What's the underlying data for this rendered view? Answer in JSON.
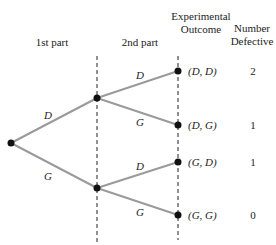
{
  "headers": {
    "stage1": "1st part",
    "stage2": "2nd part",
    "outcome_line1": "Experimental",
    "outcome_line2": "Outcome",
    "defective_line1": "Number",
    "defective_line2": "Defective"
  },
  "branches": {
    "stage1": [
      {
        "label": "D"
      },
      {
        "label": "G"
      }
    ],
    "stage2": [
      {
        "label": "D"
      },
      {
        "label": "G"
      },
      {
        "label": "D"
      },
      {
        "label": "G"
      }
    ]
  },
  "outcomes": [
    {
      "outcome": "(D, D)",
      "defective": "2"
    },
    {
      "outcome": "(D, G)",
      "defective": "1"
    },
    {
      "outcome": "(G, D)",
      "defective": "1"
    },
    {
      "outcome": "(G, G)",
      "defective": "0"
    }
  ],
  "colors": {
    "edge": "#9a9a9a",
    "node": "#111111",
    "divider": "#222222"
  }
}
